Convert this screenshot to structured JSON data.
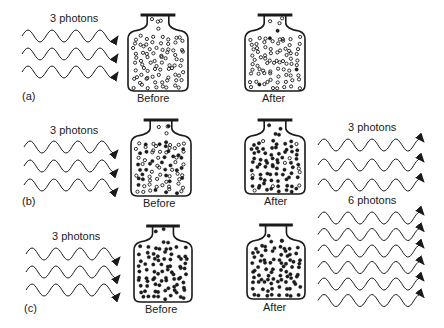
{
  "colors": {
    "ink": "#1a1a1a",
    "background": "#ffffff"
  },
  "panels": [
    {
      "id": "a",
      "label": "(a)",
      "incoming_label": "3 photons",
      "incoming_count": 3,
      "before_label": "Before",
      "after_label": "After",
      "before_dots": "hollow",
      "after_dots": "hollow-few-filled",
      "outgoing_label": "",
      "outgoing_count": 0
    },
    {
      "id": "b",
      "label": "(b)",
      "incoming_label": "3 photons",
      "incoming_count": 3,
      "before_label": "Before",
      "after_label": "After",
      "before_dots": "mixed",
      "after_dots": "mostly-filled",
      "outgoing_label": "3 photons",
      "outgoing_count": 3
    },
    {
      "id": "c",
      "label": "(c)",
      "incoming_label": "3 photons",
      "incoming_count": 3,
      "before_label": "Before",
      "after_label": "After",
      "before_dots": "filled",
      "after_dots": "filled",
      "outgoing_label": "6 photons",
      "outgoing_count": 6
    }
  ]
}
